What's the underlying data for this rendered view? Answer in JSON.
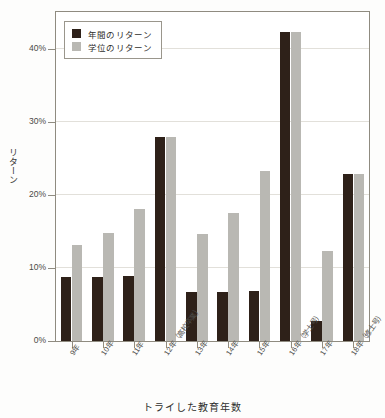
{
  "chart_data": {
    "type": "bar",
    "title": "",
    "xlabel": "トライした教育年数",
    "ylabel": "リターン",
    "ylim": [
      0,
      45
    ],
    "ytick_values": [
      0,
      10,
      20,
      30,
      40
    ],
    "ytick_labels": [
      "0%",
      "10%",
      "20%",
      "30%",
      "40%"
    ],
    "grid": true,
    "legend_position": "top-left",
    "categories": [
      "9年",
      "10年",
      "11年",
      "12年（高校卒業）",
      "13年",
      "14年",
      "15年",
      "16年（学士号）",
      "17年",
      "18年（修士号）"
    ],
    "series": [
      {
        "name": "年間のリターン",
        "color": "#2e2119",
        "values": [
          8.8,
          8.8,
          8.9,
          27.9,
          6.7,
          6.7,
          6.8,
          42.2,
          2.8,
          22.8
        ]
      },
      {
        "name": "学位のリターン",
        "color": "#b9b8b3",
        "values": [
          13.1,
          14.8,
          18.0,
          27.9,
          14.6,
          17.5,
          23.3,
          42.2,
          12.3,
          22.8
        ]
      }
    ]
  },
  "legend": {
    "items": [
      {
        "label": "年間のリターン",
        "swatch": "annual"
      },
      {
        "label": "学位のリターン",
        "swatch": "degree"
      }
    ]
  },
  "axes": {
    "y_title": "リターン",
    "x_title": "トライした教育年数"
  },
  "colors": {
    "annual": "#2e2119",
    "degree": "#b9b8b3",
    "frame": "#8f8b80",
    "grid": "#e2e0da",
    "background": "#fdfdfc"
  }
}
